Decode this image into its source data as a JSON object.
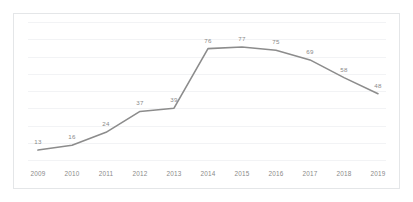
{
  "chart_data": {
    "type": "line",
    "title": "",
    "subtitle": "",
    "xlabel": "",
    "ylabel": "",
    "categories": [
      "2009",
      "2010",
      "2011",
      "2012",
      "2013",
      "2014",
      "2015",
      "2016",
      "2017",
      "2018",
      "2019"
    ],
    "values": [
      13,
      16,
      24,
      37,
      39,
      76,
      77,
      75,
      69,
      58,
      48
    ],
    "data_labels": [
      "13",
      "16",
      "24",
      "37",
      "39",
      "76",
      "77",
      "75",
      "69",
      "58",
      "48"
    ],
    "series": [
      {
        "name": "",
        "values": [
          13,
          16,
          24,
          37,
          39,
          76,
          77,
          75,
          69,
          58,
          48
        ]
      }
    ],
    "ylim": [
      0,
      88
    ],
    "xlim": [
      "2009",
      "2019"
    ],
    "grid": true,
    "grid_orientation": "horizontal",
    "gridline_count": 9,
    "legend": false,
    "legend_position": "none",
    "markers": false,
    "y_axis_labels": false,
    "line_color": "#8c8c8c",
    "grid_color": "#f2f3f5",
    "border_color": "#e4e6e8",
    "label_color": "#8a8a8a",
    "background_color": "#ffffff"
  }
}
